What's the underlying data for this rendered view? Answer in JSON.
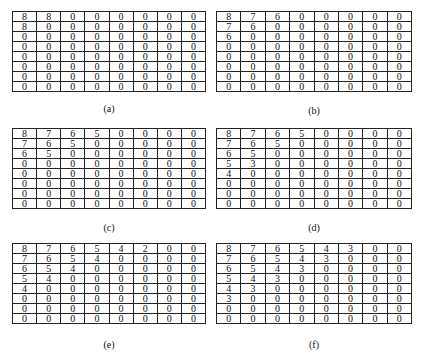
{
  "panels": [
    {
      "label": "(a)",
      "grid": [
        [
          8,
          8,
          0,
          0,
          0,
          0,
          0,
          0
        ],
        [
          8,
          0,
          0,
          0,
          0,
          0,
          0,
          0
        ],
        [
          0,
          0,
          0,
          0,
          0,
          0,
          0,
          0
        ],
        [
          0,
          0,
          0,
          0,
          0,
          0,
          0,
          0
        ],
        [
          0,
          0,
          0,
          0,
          0,
          0,
          0,
          0
        ],
        [
          0,
          0,
          0,
          0,
          0,
          0,
          0,
          0
        ],
        [
          0,
          0,
          0,
          0,
          0,
          0,
          0,
          0
        ],
        [
          0,
          0,
          0,
          0,
          0,
          0,
          0,
          0
        ]
      ]
    },
    {
      "label": "(b)",
      "grid": [
        [
          8,
          7,
          6,
          0,
          0,
          0,
          0,
          0
        ],
        [
          7,
          6,
          0,
          0,
          0,
          0,
          0,
          0
        ],
        [
          6,
          0,
          0,
          0,
          0,
          0,
          0,
          0
        ],
        [
          0,
          0,
          0,
          0,
          0,
          0,
          0,
          0
        ],
        [
          0,
          0,
          0,
          0,
          0,
          0,
          0,
          0
        ],
        [
          0,
          0,
          0,
          0,
          0,
          0,
          0,
          0
        ],
        [
          0,
          0,
          0,
          0,
          0,
          0,
          0,
          0
        ],
        [
          0,
          0,
          0,
          0,
          0,
          0,
          0,
          0
        ]
      ]
    },
    {
      "label": "(c)",
      "grid": [
        [
          8,
          7,
          6,
          5,
          0,
          0,
          0,
          0
        ],
        [
          7,
          6,
          5,
          0,
          0,
          0,
          0,
          0
        ],
        [
          6,
          5,
          0,
          0,
          0,
          0,
          0,
          0
        ],
        [
          0,
          0,
          0,
          0,
          0,
          0,
          0,
          0
        ],
        [
          0,
          0,
          0,
          0,
          0,
          0,
          0,
          0
        ],
        [
          0,
          0,
          0,
          0,
          0,
          0,
          0,
          0
        ],
        [
          0,
          0,
          0,
          0,
          0,
          0,
          0,
          0
        ],
        [
          0,
          0,
          0,
          0,
          0,
          0,
          0,
          0
        ]
      ]
    },
    {
      "label": "(d)",
      "grid": [
        [
          8,
          7,
          6,
          5,
          0,
          0,
          0,
          0
        ],
        [
          7,
          6,
          5,
          0,
          0,
          0,
          0,
          0
        ],
        [
          6,
          5,
          0,
          0,
          0,
          0,
          0,
          0
        ],
        [
          5,
          3,
          0,
          0,
          0,
          0,
          0,
          0
        ],
        [
          4,
          0,
          0,
          0,
          0,
          0,
          0,
          0
        ],
        [
          0,
          0,
          0,
          0,
          0,
          0,
          0,
          0
        ],
        [
          0,
          0,
          0,
          0,
          0,
          0,
          0,
          0
        ],
        [
          0,
          0,
          0,
          0,
          0,
          0,
          0,
          0
        ]
      ]
    },
    {
      "label": "(e)",
      "grid": [
        [
          8,
          7,
          6,
          5,
          4,
          2,
          0,
          0
        ],
        [
          7,
          6,
          5,
          4,
          0,
          0,
          0,
          0
        ],
        [
          6,
          5,
          4,
          0,
          0,
          0,
          0,
          0
        ],
        [
          5,
          4,
          0,
          0,
          0,
          0,
          0,
          0
        ],
        [
          4,
          0,
          0,
          0,
          0,
          0,
          0,
          0
        ],
        [
          0,
          0,
          0,
          0,
          0,
          0,
          0,
          0
        ],
        [
          0,
          0,
          0,
          0,
          0,
          0,
          0,
          0
        ],
        [
          0,
          0,
          0,
          0,
          0,
          0,
          0,
          0
        ]
      ]
    },
    {
      "label": "(f)",
      "grid": [
        [
          8,
          7,
          6,
          5,
          4,
          3,
          0,
          0
        ],
        [
          7,
          6,
          5,
          4,
          3,
          0,
          0,
          0
        ],
        [
          6,
          5,
          4,
          3,
          0,
          0,
          0,
          0
        ],
        [
          5,
          4,
          3,
          0,
          0,
          0,
          0,
          0
        ],
        [
          4,
          3,
          0,
          0,
          0,
          0,
          0,
          0
        ],
        [
          3,
          0,
          0,
          0,
          0,
          0,
          0,
          0
        ],
        [
          0,
          0,
          0,
          0,
          0,
          0,
          0,
          0
        ],
        [
          0,
          0,
          0,
          0,
          0,
          0,
          0,
          0
        ]
      ]
    }
  ]
}
